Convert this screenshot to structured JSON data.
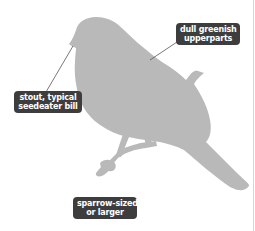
{
  "figure": {
    "silhouette_color": "#b9b9b9",
    "label_bg_color": "#3d3d3d",
    "label_text_color": "#ffffff",
    "leader_line_color": "#555555"
  },
  "labels": {
    "upperparts": {
      "line1": "dull greenish",
      "line2": "upperparts"
    },
    "bill": {
      "line1": "stout, typical",
      "line2": "seedeater bill"
    },
    "size": {
      "line1": "sparrow-sized",
      "line2": "or larger"
    }
  }
}
